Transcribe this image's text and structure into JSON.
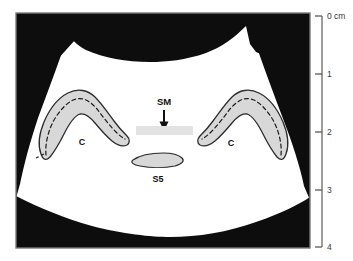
{
  "figure": {
    "type": "ultrasound-schematic",
    "modality_label": "ultrasound-sector-scan",
    "caption_fragment": ""
  },
  "scan_frame": {
    "border_color": "#7a7a7a",
    "shadow_color": "#111111",
    "tissue_color": "#ffffff"
  },
  "structures": [
    {
      "id": "cartilage-left",
      "label": "C",
      "fill": "#d8d8d8",
      "stroke": "#2b2b2b",
      "has_dashed_core": true
    },
    {
      "id": "cartilage-right",
      "label": "C",
      "fill": "#d8d8d8",
      "stroke": "#2b2b2b",
      "has_dashed_core": true
    },
    {
      "id": "submandibular-band",
      "label": "SM",
      "fill": "#e2e2e2",
      "pointer": "arrow-down"
    },
    {
      "id": "s5-structure",
      "label": "S5",
      "fill": "#d8d8d8",
      "stroke": "#2b2b2b"
    }
  ],
  "labels": {
    "cartilage_left": "C",
    "cartilage_right": "C",
    "submandibular": "SM",
    "s5": "S5"
  },
  "depth_scale": {
    "unit_label": "0 cm",
    "ticks": [
      "0 cm",
      "1",
      "2",
      "3",
      "4"
    ],
    "minor_tick_count_between": 4,
    "axis_color": "#5a5a5a",
    "top_value": 0,
    "bottom_value": 4
  },
  "icons": {
    "arrow_down": "arrow-down-icon",
    "ruler": "depth-ruler-icon"
  }
}
